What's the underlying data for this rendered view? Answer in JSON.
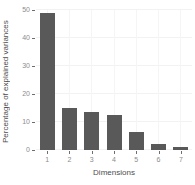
{
  "chart_data": {
    "type": "bar",
    "title": "",
    "xlabel": "Dimensions",
    "ylabel": "Percentage of explained variances",
    "categories": [
      "1",
      "2",
      "3",
      "4",
      "5",
      "6",
      "7"
    ],
    "values": [
      49,
      15,
      13.5,
      12.5,
      6.5,
      2.2,
      1.2
    ],
    "ylim": [
      0,
      50
    ],
    "yticks": [
      0,
      10,
      20,
      30,
      40,
      50
    ],
    "grid": "major horizontal and vertical, very faint",
    "legend": "none",
    "bar_width_px": 15
  },
  "style": {
    "bar_fill": "#595959",
    "axis_tick_text_color": "#8c8c8c",
    "axis_title_color": "#4d4d4d",
    "tick_mark_color": "#6e6e6e",
    "gridline_h_color": "#f2f2f2",
    "gridline_v_color": "#f5f5f5",
    "background": "#ffffff"
  }
}
